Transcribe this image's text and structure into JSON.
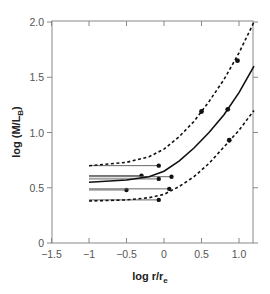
{
  "chart_data": {
    "type": "line",
    "title": "",
    "xlabel": "log r/r_e",
    "ylabel": "log (M/L_B)",
    "xlim": [
      -1.5,
      1.2
    ],
    "ylim": [
      0,
      2.0
    ],
    "x_ticks": [
      -1.5,
      -1,
      -0.5,
      0,
      0.5,
      1.0
    ],
    "x_tick_labels": [
      "−1.5",
      "−1",
      "−0.5",
      "0",
      "0.5",
      "1.0"
    ],
    "y_ticks": [
      0,
      0.5,
      1.0,
      1.5,
      2.0
    ],
    "y_tick_labels": [
      "0",
      "0.5",
      "1.0",
      "1.5",
      "2.0"
    ],
    "grid": false,
    "legend": null,
    "series": [
      {
        "name": "upper dashed bound",
        "style": "dashed",
        "x": [
          -1.0,
          -0.5,
          -0.2,
          0.0,
          0.2,
          0.4,
          0.6,
          0.8,
          1.0,
          1.2
        ],
        "y": [
          0.7,
          0.73,
          0.78,
          0.85,
          0.96,
          1.1,
          1.28,
          1.48,
          1.72,
          2.0
        ]
      },
      {
        "name": "solid model",
        "style": "solid",
        "x": [
          -1.0,
          -0.5,
          -0.2,
          0.0,
          0.2,
          0.4,
          0.6,
          0.8,
          1.0,
          1.2
        ],
        "y": [
          0.55,
          0.57,
          0.6,
          0.65,
          0.74,
          0.86,
          1.0,
          1.16,
          1.36,
          1.6
        ]
      },
      {
        "name": "lower dashed bound",
        "style": "dashed",
        "x": [
          -1.0,
          -0.5,
          -0.2,
          0.0,
          0.2,
          0.4,
          0.6,
          0.8,
          1.0,
          1.2
        ],
        "y": [
          0.38,
          0.39,
          0.41,
          0.44,
          0.51,
          0.6,
          0.72,
          0.87,
          1.02,
          1.2
        ]
      }
    ],
    "horizontal_segments": [
      {
        "x_start": -1.0,
        "x_end": -0.07,
        "y": 0.7,
        "style": "thin",
        "end_marker": true
      },
      {
        "x_start": -1.0,
        "x_end": -0.3,
        "y": 0.61,
        "style": "thin",
        "end_marker": true
      },
      {
        "x_start": -1.0,
        "x_end": 0.1,
        "y": 0.6,
        "style": "thin",
        "end_marker": true
      },
      {
        "x_start": -1.0,
        "x_end": -0.07,
        "y": 0.58,
        "style": "thin",
        "end_marker": true
      },
      {
        "x_start": -1.0,
        "x_end": -0.5,
        "y": 0.48,
        "style": "thin",
        "end_marker": true
      },
      {
        "x_start": -1.0,
        "x_end": 0.07,
        "y": 0.49,
        "style": "thin",
        "end_marker": true
      },
      {
        "x_start": -1.0,
        "x_end": -0.07,
        "y": 0.39,
        "style": "thin",
        "end_marker": true
      }
    ],
    "points": [
      {
        "x": 0.98,
        "y": 1.65
      },
      {
        "x": 0.5,
        "y": 1.19
      },
      {
        "x": 0.85,
        "y": 1.21
      },
      {
        "x": 0.87,
        "y": 0.93
      }
    ]
  }
}
